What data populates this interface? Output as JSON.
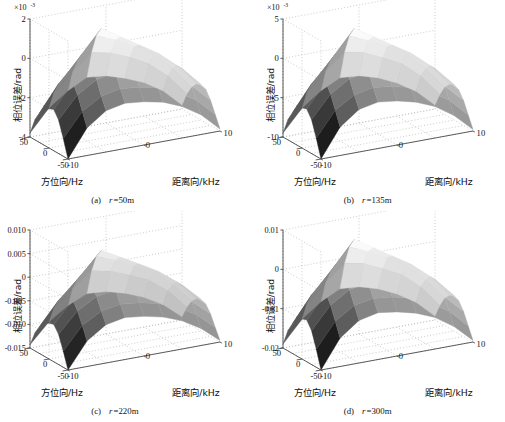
{
  "figure": {
    "background": "#ffffff",
    "panel_count": 4,
    "surface_colormap": "grayscale"
  },
  "chart_data": [
    {
      "type": "surface",
      "panel": "a",
      "caption_index": "(a)",
      "caption_var": "r",
      "caption_value": "=50m",
      "caption_full": "(a)  r=50m",
      "title": "",
      "zlabel": "相位误差/rad",
      "xlabel": "方位向/Hz",
      "ylabel": "距离向/kHz",
      "z_exponent_base": "×10",
      "z_exponent_power": "-3",
      "z_exponent_label": "×10-3",
      "zticks": [
        "2",
        "0",
        "-2",
        "-4"
      ],
      "ztick_values": [
        2,
        0,
        -2,
        -4
      ],
      "zlim": [
        -4,
        2
      ],
      "xticks": [
        "50",
        "0",
        "-50"
      ],
      "xtick_values": [
        50,
        0,
        -50
      ],
      "xlim": [
        -50,
        50
      ],
      "yticks": [
        "-10",
        "0",
        "10"
      ],
      "ytick_values": [
        -10,
        0,
        10
      ],
      "ylim": [
        -10,
        10
      ],
      "grid": true,
      "legend": "none",
      "z_peak": 2.0,
      "z_trough": -4.0,
      "surface_grid_nx": 9,
      "surface_grid_ny": 9,
      "surface_z": [
        [
          -4.0,
          -2.6,
          -1.9,
          -1.7,
          -1.8,
          -2.0,
          -2.4,
          -3.0,
          -3.9
        ],
        [
          -3.1,
          -1.9,
          -1.3,
          -1.1,
          -1.2,
          -1.4,
          -1.8,
          -2.4,
          -3.3
        ],
        [
          -2.3,
          -1.2,
          -0.6,
          -0.4,
          -0.5,
          -0.8,
          -1.2,
          -1.8,
          -2.7
        ],
        [
          -1.9,
          -0.7,
          0.0,
          0.3,
          0.1,
          -0.2,
          -0.7,
          -1.4,
          -2.3
        ],
        [
          -2.0,
          -0.6,
          0.4,
          1.0,
          0.6,
          0.1,
          -0.5,
          -1.2,
          -2.2
        ],
        [
          -2.2,
          -0.8,
          0.3,
          1.4,
          0.8,
          0.2,
          -0.4,
          -1.2,
          -2.3
        ],
        [
          -2.5,
          -1.2,
          -0.2,
          0.9,
          0.5,
          0.0,
          -0.6,
          -1.5,
          -2.6
        ],
        [
          -3.0,
          -1.8,
          -0.9,
          -0.1,
          -0.3,
          -0.7,
          -1.2,
          -2.0,
          -3.1
        ],
        [
          -3.8,
          -2.7,
          -2.0,
          -1.5,
          -1.6,
          -1.9,
          -2.3,
          -2.9,
          -3.8
        ]
      ]
    },
    {
      "type": "surface",
      "panel": "b",
      "caption_index": "(b)",
      "caption_var": "r",
      "caption_value": "=135m",
      "caption_full": "(b)  r=135m",
      "title": "",
      "zlabel": "相位误差/rad",
      "xlabel": "方位向/Hz",
      "ylabel": "距离向/kHz",
      "z_exponent_base": "×10",
      "z_exponent_power": "-3",
      "z_exponent_label": "×10-3",
      "zticks": [
        "5",
        "0",
        "-5",
        "-10"
      ],
      "ztick_values": [
        5,
        0,
        -5,
        -10
      ],
      "zlim": [
        -10,
        5
      ],
      "xticks": [
        "50",
        "0",
        "-50"
      ],
      "xtick_values": [
        50,
        0,
        -50
      ],
      "xlim": [
        -50,
        50
      ],
      "yticks": [
        "-10",
        "0",
        "10"
      ],
      "ytick_values": [
        -10,
        0,
        10
      ],
      "ylim": [
        -10,
        10
      ],
      "grid": true,
      "legend": "none",
      "z_peak": 5.0,
      "z_trough": -10.0,
      "surface_grid_nx": 9,
      "surface_grid_ny": 9,
      "surface_z": [
        [
          -10.0,
          -6.4,
          -4.6,
          -4.1,
          -4.4,
          -5.0,
          -6.0,
          -7.6,
          -9.8
        ],
        [
          -7.7,
          -4.6,
          -3.1,
          -2.6,
          -2.9,
          -3.5,
          -4.5,
          -6.0,
          -8.3
        ],
        [
          -5.7,
          -2.9,
          -1.4,
          -0.9,
          -1.2,
          -1.9,
          -3.0,
          -4.5,
          -6.8
        ],
        [
          -4.7,
          -1.7,
          -0.1,
          0.7,
          0.2,
          -0.6,
          -1.7,
          -3.4,
          -5.8
        ],
        [
          -4.9,
          -1.4,
          1.0,
          2.5,
          1.5,
          0.2,
          -1.3,
          -3.0,
          -5.5
        ],
        [
          -5.4,
          -2.0,
          0.7,
          3.5,
          2.0,
          0.5,
          -1.0,
          -3.0,
          -5.8
        ],
        [
          -6.2,
          -3.0,
          -0.5,
          2.2,
          1.2,
          0.0,
          -1.5,
          -3.8,
          -6.5
        ],
        [
          -7.5,
          -4.5,
          -2.2,
          -0.2,
          -0.7,
          -1.8,
          -3.0,
          -5.0,
          -7.8
        ],
        [
          -9.5,
          -6.8,
          -5.0,
          -3.8,
          -4.0,
          -4.7,
          -5.8,
          -7.3,
          -9.5
        ]
      ]
    },
    {
      "type": "surface",
      "panel": "c",
      "caption_index": "(c)",
      "caption_var": "r",
      "caption_value": "=220m",
      "caption_full": "(c)  r=220m",
      "title": "",
      "zlabel": "相位误差/rad",
      "xlabel": "方位向/Hz",
      "ylabel": "距离向/kHz",
      "z_exponent_base": "",
      "z_exponent_power": "",
      "z_exponent_label": "",
      "zticks": [
        "0.010",
        "0.005",
        "0",
        "-0.005",
        "-0.010",
        "-0.015"
      ],
      "ztick_values": [
        0.01,
        0.005,
        0,
        -0.005,
        -0.01,
        -0.015
      ],
      "zlim": [
        -0.015,
        0.01
      ],
      "xticks": [
        "50",
        "0",
        "-50"
      ],
      "xtick_values": [
        50,
        0,
        -50
      ],
      "xlim": [
        -50,
        50
      ],
      "yticks": [
        "-10",
        "0",
        "10"
      ],
      "ytick_values": [
        -10,
        0,
        10
      ],
      "ylim": [
        -10,
        10
      ],
      "grid": true,
      "legend": "none",
      "z_peak": 0.01,
      "z_trough": -0.015,
      "surface_grid_nx": 9,
      "surface_grid_ny": 9,
      "surface_z": [
        [
          -0.015,
          -0.0096,
          -0.0069,
          -0.0061,
          -0.0066,
          -0.0075,
          -0.009,
          -0.0114,
          -0.0147
        ],
        [
          -0.0116,
          -0.0069,
          -0.0046,
          -0.0039,
          -0.0043,
          -0.0052,
          -0.0068,
          -0.009,
          -0.0125
        ],
        [
          -0.0086,
          -0.0044,
          -0.0021,
          -0.0014,
          -0.0018,
          -0.0029,
          -0.0045,
          -0.0068,
          -0.0102
        ],
        [
          -0.0071,
          -0.0026,
          -0.0002,
          0.001,
          0.0003,
          -0.0009,
          -0.0026,
          -0.0051,
          -0.0087
        ],
        [
          -0.0074,
          -0.0021,
          0.0015,
          0.0038,
          0.0022,
          0.0003,
          -0.002,
          -0.0045,
          -0.0083
        ],
        [
          -0.0081,
          -0.003,
          0.001,
          0.0052,
          0.003,
          0.0008,
          -0.0015,
          -0.0045,
          -0.0087
        ],
        [
          -0.0093,
          -0.0045,
          -0.0008,
          0.0033,
          0.0018,
          0.0,
          -0.0023,
          -0.0057,
          -0.0098
        ],
        [
          -0.0113,
          -0.0068,
          -0.0033,
          -0.0003,
          -0.0011,
          -0.0027,
          -0.0045,
          -0.0075,
          -0.0117
        ],
        [
          -0.0143,
          -0.0102,
          -0.0075,
          -0.0057,
          -0.006,
          -0.0071,
          -0.0087,
          -0.011,
          -0.0143
        ]
      ]
    },
    {
      "type": "surface",
      "panel": "d",
      "caption_index": "(d)",
      "caption_var": "r",
      "caption_value": "=300m",
      "caption_full": "(d)  r=300m",
      "title": "",
      "zlabel": "相位误差/rad",
      "xlabel": "方位向/Hz",
      "ylabel": "距离向/kHz",
      "z_exponent_base": "",
      "z_exponent_power": "",
      "z_exponent_label": "",
      "zticks": [
        "0.01",
        "0",
        "-0.01",
        "-0.02"
      ],
      "ztick_values": [
        0.01,
        0,
        -0.01,
        -0.02
      ],
      "zlim": [
        -0.02,
        0.01
      ],
      "xticks": [
        "50",
        "0",
        "-50"
      ],
      "xtick_values": [
        50,
        0,
        -50
      ],
      "xlim": [
        -50,
        50
      ],
      "yticks": [
        "-10",
        "0",
        "10"
      ],
      "ytick_values": [
        -10,
        0,
        10
      ],
      "ylim": [
        -10,
        10
      ],
      "grid": true,
      "legend": "none",
      "z_peak": 0.01,
      "z_trough": -0.02,
      "surface_grid_nx": 9,
      "surface_grid_ny": 9,
      "surface_z": [
        [
          -0.02,
          -0.0128,
          -0.0092,
          -0.0081,
          -0.0088,
          -0.01,
          -0.012,
          -0.0152,
          -0.0196
        ],
        [
          -0.0154,
          -0.0092,
          -0.0061,
          -0.0052,
          -0.0057,
          -0.0069,
          -0.009,
          -0.012,
          -0.0166
        ],
        [
          -0.0114,
          -0.0058,
          -0.0028,
          -0.0018,
          -0.0024,
          -0.0038,
          -0.006,
          -0.009,
          -0.0136
        ],
        [
          -0.0094,
          -0.0034,
          -0.0002,
          0.0014,
          0.0004,
          -0.0012,
          -0.0034,
          -0.0068,
          -0.0116
        ],
        [
          -0.0098,
          -0.0028,
          0.002,
          0.005,
          0.003,
          0.0004,
          -0.0026,
          -0.006,
          -0.011
        ],
        [
          -0.0108,
          -0.004,
          0.0014,
          0.007,
          0.004,
          0.001,
          -0.002,
          -0.006,
          -0.0116
        ],
        [
          -0.0124,
          -0.006,
          -0.001,
          0.0044,
          0.0024,
          0.0,
          -0.003,
          -0.0076,
          -0.013
        ],
        [
          -0.015,
          -0.009,
          -0.0044,
          -0.0004,
          -0.0014,
          -0.0036,
          -0.006,
          -0.01,
          -0.0156
        ],
        [
          -0.019,
          -0.0136,
          -0.01,
          -0.0076,
          -0.008,
          -0.0094,
          -0.0116,
          -0.0146,
          -0.019
        ]
      ]
    }
  ]
}
